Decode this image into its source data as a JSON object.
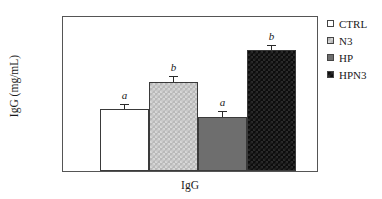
{
  "chart_data": {
    "type": "bar",
    "title": "",
    "subtitle": "",
    "xlabel": "IgG",
    "ylabel": "IgG  (mg/mL)",
    "categories": [
      "IgG"
    ],
    "ylim": [
      10,
      35
    ],
    "yticks": [
      10,
      15,
      20,
      25,
      30,
      35
    ],
    "ytick_labels": [
      "10",
      "15",
      "20",
      "25",
      "30",
      "35"
    ],
    "grid": false,
    "legend_position": "right",
    "series": [
      {
        "name": "CTRL",
        "values": [
          20.0
        ],
        "error": [
          0.8
        ],
        "annotation": "a",
        "fill": "white",
        "color": "#ffffff"
      },
      {
        "name": "N3",
        "values": [
          24.5
        ],
        "error": [
          0.9
        ],
        "annotation": "b",
        "fill": "light-checker",
        "color": "#c7c7c7"
      },
      {
        "name": "HP",
        "values": [
          18.8
        ],
        "error": [
          1.0
        ],
        "annotation": "a",
        "fill": "dark-gray",
        "color": "#6e6e6e"
      },
      {
        "name": "HPN3",
        "values": [
          29.7
        ],
        "error": [
          0.8
        ],
        "annotation": "b",
        "fill": "black-checker",
        "color": "#0d0d0d"
      }
    ]
  },
  "legend": {
    "items": [
      {
        "label": "CTRL"
      },
      {
        "label": "N3"
      },
      {
        "label": "HP"
      },
      {
        "label": "HPN3"
      }
    ]
  },
  "axes": {
    "y_title": "IgG  (mg/mL)",
    "x_title": "IgG"
  }
}
